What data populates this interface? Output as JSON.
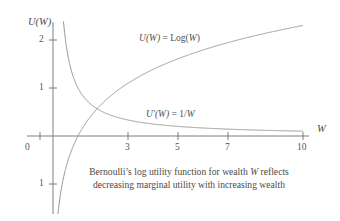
{
  "chart_data": {
    "type": "line",
    "title": "",
    "xlabel": "W",
    "ylabel": "U(W)",
    "xlim": [
      -0.6,
      11.2
    ],
    "ylim": [
      -1.6,
      2.55
    ],
    "grid": false,
    "legend": "inline-labels",
    "xticks": [
      {
        "value": 0,
        "label": "0"
      },
      {
        "value": 3,
        "label": "3"
      },
      {
        "value": 5,
        "label": "5"
      },
      {
        "value": 7,
        "label": "7"
      },
      {
        "value": 10,
        "label": "10"
      }
    ],
    "yticks": [
      {
        "value": 2,
        "label": "2"
      },
      {
        "value": 1,
        "label": "1"
      },
      {
        "value": -1,
        "label": "1"
      }
    ],
    "series": [
      {
        "name": "U(W) = Log(W)",
        "label_text": "U(W) = Log(W)",
        "formula": "ln(W)",
        "x": [
          0.2,
          0.35,
          0.5,
          0.75,
          1,
          1.5,
          2,
          2.5,
          3,
          3.5,
          4,
          5,
          6,
          7,
          8,
          9,
          10
        ],
        "values": [
          -1.61,
          -1.05,
          -0.69,
          -0.29,
          0,
          0.41,
          0.69,
          0.92,
          1.1,
          1.25,
          1.39,
          1.61,
          1.79,
          1.95,
          2.08,
          2.2,
          2.3
        ]
      },
      {
        "name": "U'(W) = 1/W",
        "label_text": "U'(W) = 1/W",
        "formula": "1/W",
        "x": [
          1,
          1.25,
          1.5,
          2,
          2.5,
          3,
          3.5,
          4,
          5,
          6,
          7,
          8,
          9,
          10
        ],
        "values": [
          1.0,
          0.8,
          0.667,
          0.5,
          0.4,
          0.333,
          0.286,
          0.25,
          0.2,
          0.167,
          0.143,
          0.125,
          0.111,
          0.1
        ]
      }
    ],
    "annotations": [
      {
        "name": "log-curve-label",
        "text": "U(W) = Log(W)",
        "x": 3.0,
        "y": 2.0
      },
      {
        "name": "derivative-curve-label",
        "text": "U'(W) = 1/W",
        "x": 5.0,
        "y": 0.63
      }
    ]
  },
  "axes": {
    "y_title": "U(W)",
    "x_title": "W"
  },
  "curve_labels": {
    "log": {
      "fn": "U",
      "arg": "(W)",
      "eq": " = Log(",
      "argb": "W",
      "close": ")"
    },
    "deriv": {
      "fn": "U′",
      "arg": "(W)",
      "eq": " = 1/",
      "argb": "W"
    }
  },
  "tick_labels": {
    "y2": "2",
    "y1": "1",
    "yneg1": "1",
    "x0": "0",
    "x3": "3",
    "x5": "5",
    "x7": "7",
    "x10": "10"
  },
  "caption": {
    "line1_a": "Bernoulli’s log utility function for wealth ",
    "line1_italic": "W",
    "line1_b": " reflects",
    "line2": "decreasing marginal utility with increasing wealth"
  },
  "colors": {
    "axis": "#6f6f6f",
    "curve": "#8a8a8a",
    "text": "#4a4a4a"
  }
}
